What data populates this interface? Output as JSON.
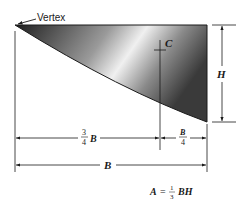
{
  "figure": {
    "type": "spandrel-area-diagram",
    "labels": {
      "vertex": "Vertex",
      "centroid": "C",
      "height": "H",
      "base": "B",
      "three_quarter_num": "3",
      "three_quarter_den": "4",
      "three_quarter_var": "B",
      "quarter_num": "B",
      "quarter_den": "4"
    },
    "formula": {
      "lhs": "A",
      "equals": "=",
      "frac_num": "1",
      "frac_den": "3",
      "rhs": "BH"
    },
    "colors": {
      "line": "#1a1a1a",
      "fill_dark": "#2a2a2a",
      "fill_light": "#e8e8e8",
      "background": "#ffffff"
    }
  }
}
